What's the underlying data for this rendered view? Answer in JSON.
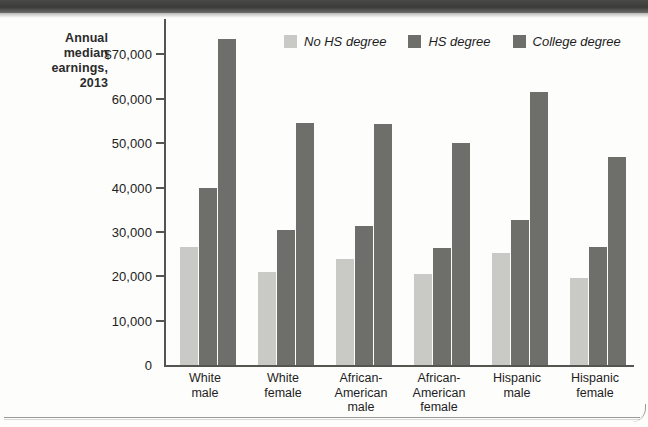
{
  "page": {
    "background": "#fdfdfc",
    "top_band_color": "#3b3b39"
  },
  "chart_data": {
    "type": "bar",
    "title": "Annual median earnings, 2013",
    "title_lines": [
      "Annual",
      "median",
      "earnings,",
      "2013"
    ],
    "xlabel": "",
    "ylabel": "Annual median earnings, 2013",
    "ylim": [
      0,
      78000
    ],
    "grid": false,
    "legend_position": "top-center",
    "y_ticks": [
      0,
      10000,
      20000,
      30000,
      40000,
      50000,
      60000,
      70000
    ],
    "y_tick_labels": [
      "0",
      "10,000",
      "20,000",
      "30,000",
      "40,000",
      "50,000",
      "60,000",
      "$70,000"
    ],
    "categories": [
      "White male",
      "White female",
      "African-American male",
      "African-American female",
      "Hispanic male",
      "Hispanic female"
    ],
    "category_lines": [
      [
        "White",
        "male"
      ],
      [
        "White",
        "female"
      ],
      [
        "African-",
        "American",
        "male"
      ],
      [
        "African-",
        "American",
        "female"
      ],
      [
        "Hispanic",
        "male"
      ],
      [
        "Hispanic",
        "female"
      ]
    ],
    "series": [
      {
        "name": "No HS degree",
        "color": "#c9c9c6",
        "values": [
          26500,
          21000,
          23900,
          20500,
          25200,
          19600
        ]
      },
      {
        "name": "HS degree",
        "color": "#6e6e6b",
        "values": [
          40000,
          30500,
          31300,
          26300,
          32600,
          26500
        ]
      },
      {
        "name": "College degree",
        "color": "#6e6e6b",
        "values": [
          73500,
          54500,
          54300,
          50000,
          61500,
          47000
        ]
      }
    ]
  }
}
